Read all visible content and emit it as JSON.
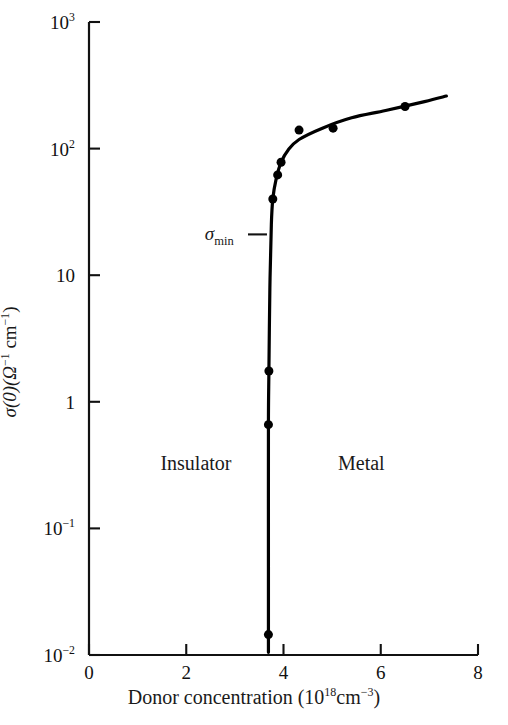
{
  "chart_data": {
    "type": "line",
    "title": "",
    "subtitle": "",
    "xlabel_text": "Donor concentration (10",
    "xlabel_sup": "18",
    "xlabel_text2": "cm",
    "xlabel_sup2": "−3",
    "xlabel_text3": ")",
    "xlabel": "Donor concentration (10^18 cm^-3)",
    "ylabel": "σ(0)(Ω^-1 cm^-1)",
    "ylabel_sigma": "σ(0)(",
    "ylabel_omega": "Ω",
    "ylabel_sup1": "−1",
    "ylabel_cm": " cm",
    "ylabel_sup2": "−1",
    "ylabel_close": ")",
    "xscale": "linear",
    "yscale": "log",
    "xlim": [
      0,
      8
    ],
    "ylim": [
      0.01,
      1000
    ],
    "grid": false,
    "legend": null,
    "xticks": [
      {
        "value": 0,
        "label": "0"
      },
      {
        "value": 2,
        "label": "2"
      },
      {
        "value": 4,
        "label": "4"
      },
      {
        "value": 6,
        "label": "6"
      },
      {
        "value": 8,
        "label": "8"
      }
    ],
    "yticks": [
      {
        "value": 1000,
        "mantissa": "10",
        "exponent": "3"
      },
      {
        "value": 100,
        "mantissa": "10",
        "exponent": "2"
      },
      {
        "value": 10,
        "mantissa": "10",
        "exponent": ""
      },
      {
        "value": 1,
        "mantissa": "1",
        "exponent": ""
      },
      {
        "value": 0.1,
        "mantissa": "10",
        "exponent": "−1"
      },
      {
        "value": 0.01,
        "mantissa": "10",
        "exponent": "−2"
      }
    ],
    "series": [
      {
        "name": "conductivity",
        "style": "solid-line-with-markers",
        "color": "#000000",
        "linewidth": 3.2,
        "marker": "filled-circle",
        "markersize": 9,
        "points": [
          {
            "x": 3.69,
            "y": 0.0145
          },
          {
            "x": 3.69,
            "y": 0.66
          },
          {
            "x": 3.7,
            "y": 1.75
          },
          {
            "x": 3.78,
            "y": 40
          },
          {
            "x": 3.88,
            "y": 62
          },
          {
            "x": 3.95,
            "y": 78
          },
          {
            "x": 4.32,
            "y": 140
          },
          {
            "x": 5.02,
            "y": 145
          },
          {
            "x": 6.5,
            "y": 215
          }
        ],
        "curve": [
          {
            "x": 3.69,
            "y": 0.0105
          },
          {
            "x": 3.69,
            "y": 0.05
          },
          {
            "x": 3.69,
            "y": 0.66
          },
          {
            "x": 3.7,
            "y": 1.75
          },
          {
            "x": 3.72,
            "y": 8
          },
          {
            "x": 3.75,
            "y": 25
          },
          {
            "x": 3.78,
            "y": 40
          },
          {
            "x": 3.85,
            "y": 58
          },
          {
            "x": 3.95,
            "y": 78
          },
          {
            "x": 4.1,
            "y": 98
          },
          {
            "x": 4.32,
            "y": 118
          },
          {
            "x": 4.8,
            "y": 145
          },
          {
            "x": 5.4,
            "y": 175
          },
          {
            "x": 6.1,
            "y": 200
          },
          {
            "x": 6.9,
            "y": 235
          },
          {
            "x": 7.35,
            "y": 260
          }
        ]
      }
    ],
    "annotations": [
      {
        "name": "sigma-min",
        "text": "σ",
        "subscript": "min",
        "label": "σmin",
        "x_text": 3.1,
        "y_text": 21,
        "leader_x_start": 3.27,
        "leader_x_end": 3.66,
        "leader_y": 21
      },
      {
        "name": "insulator",
        "label": "Insulator",
        "x": 2.2,
        "y": 0.33
      },
      {
        "name": "metal",
        "label": "Metal",
        "x": 5.6,
        "y": 0.33
      }
    ]
  },
  "colors": {
    "ink": "#111111",
    "curve": "#000000",
    "background": "#ffffff"
  }
}
